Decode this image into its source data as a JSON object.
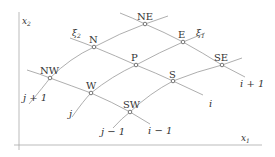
{
  "diagram": {
    "type": "curvilinear-grid-stencil",
    "colors": {
      "line": "#999999",
      "axis": "#aaaaaa",
      "text": "#333333",
      "node_fill": "#ffffff",
      "node_stroke": "#555555"
    },
    "axes": {
      "x_label": "x",
      "x_sub": "1",
      "y_label": "x",
      "y_sub": "2"
    },
    "curvilinear_axes": {
      "xi1_label": "ξ",
      "xi1_sub": "1",
      "xi2_label": "ξ",
      "xi2_sub": "2"
    },
    "nodes": [
      {
        "id": "NE",
        "label": "NE",
        "x": 145,
        "y": 24
      },
      {
        "id": "N",
        "label": "N",
        "x": 94,
        "y": 47
      },
      {
        "id": "E",
        "label": "E",
        "x": 183,
        "y": 42
      },
      {
        "id": "P",
        "label": "P",
        "x": 136,
        "y": 65
      },
      {
        "id": "NW",
        "label": "NW",
        "x": 50,
        "y": 78
      },
      {
        "id": "SE",
        "label": "SE",
        "x": 222,
        "y": 65
      },
      {
        "id": "W",
        "label": "W",
        "x": 91,
        "y": 93
      },
      {
        "id": "S",
        "label": "S",
        "x": 173,
        "y": 81
      },
      {
        "id": "SW",
        "label": "SW",
        "x": 130,
        "y": 112
      }
    ],
    "grid_line_labels": {
      "j_plus_1": "j + 1",
      "j": "j",
      "j_minus_1": "j − 1",
      "i_minus_1": "i − 1",
      "i": "i",
      "i_plus_1": "i + 1"
    }
  }
}
